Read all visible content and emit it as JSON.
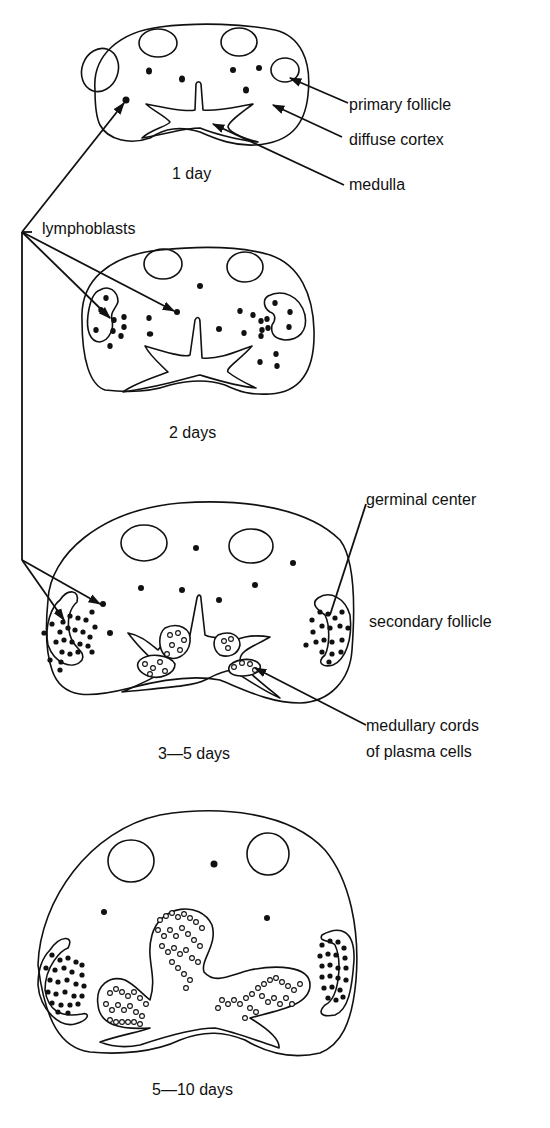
{
  "figure": {
    "stages": [
      {
        "label": "1 day"
      },
      {
        "label": "2 days"
      },
      {
        "label": "3—5 days"
      },
      {
        "label": "5—10 days"
      }
    ],
    "annotations": {
      "primary_follicle": "primary follicle",
      "diffuse_cortex": "diffuse cortex",
      "medulla": "medulla",
      "lymphoblasts": "lymphoblasts",
      "germinal_center": "germinal center",
      "secondary_follicle": "secondary follicle",
      "medullary_cords_line1": "medullary cords",
      "medullary_cords_line2": "of plasma cells"
    },
    "colors": {
      "ink": "#111111",
      "background": "#ffffff"
    }
  }
}
